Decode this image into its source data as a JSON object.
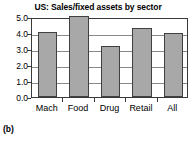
{
  "caption": "(b)",
  "chart_data": {
    "type": "bar",
    "title": "US: Sales/fixed assets by sector",
    "xlabel": "",
    "ylabel": "",
    "categories": [
      "Mach",
      "Food",
      "Drug",
      "Retail",
      "All"
    ],
    "values": [
      4.05,
      5.05,
      3.2,
      4.3,
      4.0
    ],
    "ylim": [
      0.0,
      5.0
    ],
    "ytick_labels": [
      "0.0",
      "1.0",
      "2.0",
      "3.0",
      "4.0",
      "5.0"
    ],
    "ytick_values": [
      0.0,
      1.0,
      2.0,
      3.0,
      4.0,
      5.0
    ],
    "grid": true,
    "legend": false,
    "bar_color": "#a8a8a8",
    "bar_edge_color": "#404040",
    "axis_color": "#3a3a3a",
    "gridline_color": "#8a8a8a"
  }
}
